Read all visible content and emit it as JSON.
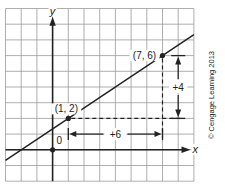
{
  "chart_data": {
    "type": "line",
    "title": "",
    "xlabel": "x",
    "ylabel": "y",
    "origin_label": "0",
    "grid": true,
    "xlim": [
      -3,
      9
    ],
    "ylim": [
      -2,
      9
    ],
    "line": {
      "slope": 0.6667,
      "intercept": 1.3333,
      "description": "Line through (1, 2) and (7, 6)"
    },
    "points": [
      {
        "x": 0,
        "y": 0,
        "label": "",
        "role": "origin"
      },
      {
        "x": 1,
        "y": 2,
        "label": "(1, 2)"
      },
      {
        "x": 7,
        "y": 6,
        "label": "(7, 6)"
      }
    ],
    "annotations": [
      {
        "type": "run",
        "label": "+6",
        "from": [
          1,
          1
        ],
        "to": [
          7,
          1
        ]
      },
      {
        "type": "rise",
        "label": "+4",
        "from": [
          8,
          2
        ],
        "to": [
          8,
          6
        ]
      }
    ]
  },
  "labels": {
    "x_axis": "x",
    "y_axis": "y",
    "origin": "0",
    "point_a": "(1, 2)",
    "point_b": "(7, 6)",
    "run": "+6",
    "rise": "+4",
    "copyright": "© Cengage Learning 2013"
  },
  "colors": {
    "grid": "#8a8a8a",
    "axis": "#222222",
    "line": "#222222",
    "background": "#ffffff"
  }
}
